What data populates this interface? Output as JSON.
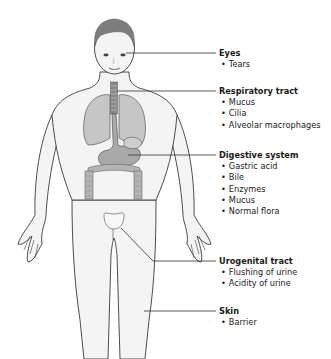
{
  "diagram": {
    "title": "",
    "colors": {
      "outline": "#3a3a3a",
      "skin_fill": "#f4f4f4",
      "organ_fill": "#b9b9b9",
      "hair": "#7d7d7d",
      "leader_line": "#333333",
      "text": "#1a1a1a"
    },
    "labels": [
      {
        "id": "eyes",
        "title": "Eyes",
        "items": [
          "Tears"
        ]
      },
      {
        "id": "respiratory",
        "title": "Respiratory tract",
        "items": [
          "Mucus",
          "Cilia",
          "Alveolar macrophages"
        ]
      },
      {
        "id": "digestive",
        "title": "Digestive system",
        "items": [
          "Gastric acid",
          "Bile",
          "Enzymes",
          "Mucus",
          "Normal flora"
        ]
      },
      {
        "id": "urogenital",
        "title": "Urogenital tract",
        "items": [
          "Flushing of urine",
          "Acidity of urine"
        ]
      },
      {
        "id": "skin",
        "title": "Skin",
        "items": [
          "Barrier"
        ]
      }
    ]
  }
}
